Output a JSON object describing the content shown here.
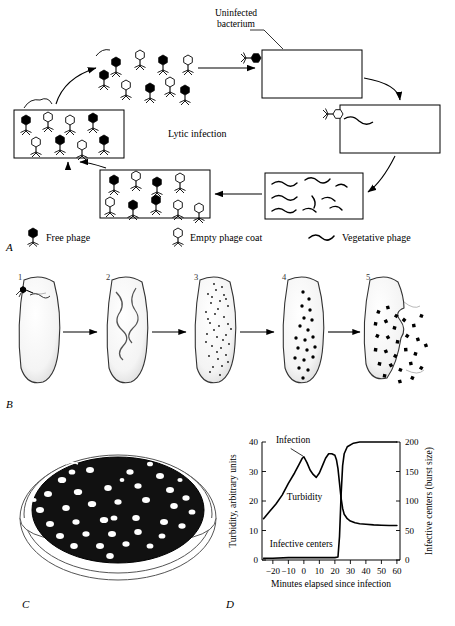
{
  "figure": {
    "panels": [
      {
        "letter": "A",
        "name": "lytic-infection-cycle"
      },
      {
        "letter": "B",
        "name": "infection-stages"
      },
      {
        "letter": "C",
        "name": "plaque-assay-plate"
      },
      {
        "letter": "D",
        "name": "one-step-growth-curve"
      }
    ]
  },
  "panel_a": {
    "center_label": "Lytic infection",
    "callout_label": "Uninfected\nbacterium",
    "callout_line1": "Uninfected",
    "callout_line2": "bacterium",
    "legend": [
      {
        "key": "free-phage",
        "label": "Free phage",
        "glyph": "filled-phage-icon"
      },
      {
        "key": "empty-phage-coat",
        "label": "Empty phage coat",
        "glyph": "open-phage-icon"
      },
      {
        "key": "vegetative-phage",
        "label": "Vegetative phage",
        "glyph": "squiggle-icon"
      }
    ]
  },
  "panel_b": {
    "stage_numbers": [
      "1",
      "2",
      "3",
      "4",
      "5"
    ]
  },
  "panel_c": {
    "description": "petri dish with plaques"
  },
  "chart_data": {
    "type": "line",
    "title": "",
    "xlabel": "Minutes elapsed since infection",
    "ylabel": "Turbidity, arbitrary units",
    "y2label": "Infective centers (burst size)",
    "xlim": [
      -27,
      62
    ],
    "ylim": [
      0,
      40
    ],
    "y2lim": [
      0,
      200
    ],
    "xticks": [
      -20,
      -10,
      0,
      10,
      20,
      30,
      40,
      50,
      60
    ],
    "xticklabels": [
      "−20",
      "−10",
      "0",
      "10",
      "20",
      "30",
      "40",
      "50",
      "60"
    ],
    "yticks": [
      0,
      10,
      20,
      30,
      40
    ],
    "yticklabels": [
      "0",
      "10",
      "20",
      "30",
      "40"
    ],
    "y2ticks": [
      0,
      50,
      100,
      150,
      200
    ],
    "y2ticklabels": [
      "0",
      "50",
      "100",
      "150",
      "200"
    ],
    "grid": false,
    "annotations": [
      {
        "text": "Infection",
        "x": -18,
        "y": 39.5,
        "name": "infection-annotation"
      },
      {
        "text": "Turbidity",
        "x": -11,
        "y": 20.5,
        "name": "turbidity-annotation"
      },
      {
        "text": "Infective centers",
        "x": -22,
        "y": 4.5,
        "name": "infective-centers-annotation"
      }
    ],
    "leader_line": {
      "from_x": -8.5,
      "from_y": 37.8,
      "to_x": -0.5,
      "to_y": 35.2
    },
    "series": [
      {
        "name": "Turbidity",
        "axis": "left",
        "x": [
          -26,
          -22,
          -18,
          -14,
          -10,
          -6,
          -3,
          -1,
          0,
          2,
          4,
          6,
          8,
          10,
          12,
          14,
          16,
          18,
          20,
          21,
          22,
          23,
          24,
          25,
          26,
          28,
          30,
          33,
          36,
          40,
          45,
          50,
          55,
          60
        ],
        "values": [
          14,
          16.5,
          19,
          22,
          26,
          29.5,
          32.5,
          34.5,
          35,
          33,
          30.5,
          29,
          28,
          29.5,
          32,
          34.5,
          36,
          36,
          35.5,
          34,
          31,
          26,
          21,
          17.5,
          15.5,
          14,
          13.2,
          12.6,
          12.3,
          12.1,
          11.9,
          11.8,
          11.7,
          11.7
        ]
      },
      {
        "name": "Infective centers",
        "axis": "right",
        "x": [
          -26,
          -20,
          -10,
          0,
          10,
          20,
          22,
          23,
          24,
          25,
          26,
          28,
          32,
          36,
          40,
          50,
          60
        ],
        "values": [
          3,
          3,
          4,
          4,
          4,
          4,
          5,
          40,
          110,
          160,
          180,
          192,
          198,
          200,
          200,
          200,
          200
        ]
      }
    ]
  }
}
